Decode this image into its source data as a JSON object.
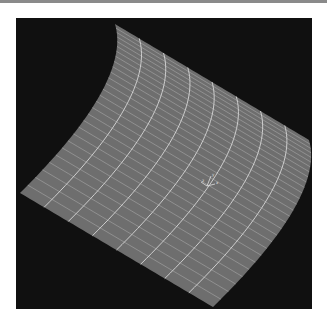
{
  "viewport": {
    "background": "#101010",
    "rect": [
      16,
      18,
      296,
      291
    ]
  },
  "surface": {
    "type": "wireframe-mesh",
    "fill": "#6e6e6e",
    "line_color": "#b4b4b4",
    "major_line_color": "#d8d8d8",
    "corners": {
      "top_left": [
        115,
        24
      ],
      "top_right": [
        309,
        140
      ],
      "bottom_right": [
        213,
        307
      ],
      "bottom_left": [
        20,
        193
      ]
    },
    "curvature_offset": 38,
    "rows": 28,
    "major_columns": 8
  },
  "axis_triad": {
    "origin": [
      207,
      186
    ],
    "labels": [
      "x",
      "y",
      "z"
    ],
    "color": "#e0e0e0"
  }
}
